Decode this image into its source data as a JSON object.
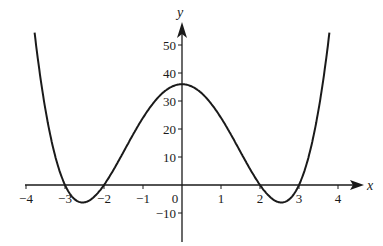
{
  "chart_data": {
    "type": "line",
    "title": "",
    "xlabel": "x",
    "ylabel": "y",
    "function": "y = (x^2 - 4)(x^2 - 9)",
    "xlim": [
      -4,
      4
    ],
    "ylim": [
      -10,
      55
    ],
    "grid": false,
    "legend": null,
    "x_ticks": [
      -4,
      -3,
      -2,
      -1,
      0,
      1,
      2,
      3,
      4
    ],
    "x_tick_labels": [
      "−4",
      "−3",
      "−2",
      "−1",
      "0",
      "1",
      "2",
      "3",
      "4"
    ],
    "y_ticks": [
      -10,
      10,
      20,
      30,
      40,
      50
    ],
    "y_tick_labels": [
      "−10",
      "10",
      "20",
      "30",
      "40",
      "50"
    ],
    "series": [
      {
        "name": "curve",
        "x": [
          -3.76,
          -3.5,
          -3,
          -2.55,
          -2,
          -1.5,
          -1,
          -0.5,
          0,
          0.5,
          1,
          1.5,
          2,
          2.55,
          3,
          3.5,
          3.76
        ],
        "y": [
          52,
          23.3,
          0,
          -6.25,
          0,
          13.8,
          24,
          32.8,
          36,
          32.8,
          24,
          13.8,
          0,
          -6.25,
          0,
          23.3,
          52
        ]
      }
    ],
    "key_points": {
      "roots": [
        -3,
        -2,
        2,
        3
      ],
      "local_max": {
        "x": 0,
        "y": 36
      },
      "local_mins": [
        {
          "x": -2.55,
          "y": -6.25
        },
        {
          "x": 2.55,
          "y": -6.25
        }
      ]
    }
  },
  "labels": {
    "x_axis": "x",
    "y_axis": "y",
    "origin": "0"
  },
  "colors": {
    "line": "#1a1a1a",
    "background": "#ffffff"
  }
}
